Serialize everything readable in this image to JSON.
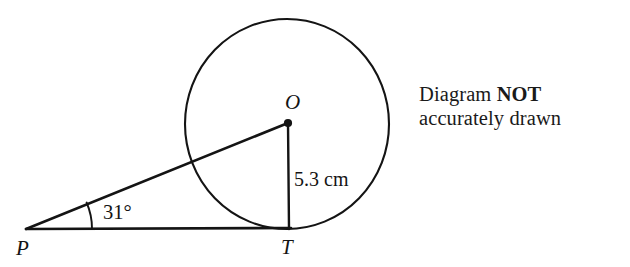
{
  "figure": {
    "type": "circle-tangent-geometry",
    "points": [
      {
        "id": "P",
        "label": "P",
        "role": "external-point",
        "x": 26,
        "y": 229
      },
      {
        "id": "T",
        "label": "T",
        "role": "tangent-point",
        "x": 289,
        "y": 228
      },
      {
        "id": "O",
        "label": "O",
        "role": "circle-center",
        "x": 288,
        "y": 123
      }
    ],
    "circle": {
      "center_x": 287,
      "center_y": 124,
      "radius_x": 102,
      "radius_y": 105
    },
    "segments": [
      {
        "id": "PO",
        "from": "P",
        "to": "O",
        "role": "hypotenuse"
      },
      {
        "id": "PT",
        "from": "P",
        "to": "T",
        "role": "tangent-line"
      },
      {
        "id": "OT",
        "from": "O",
        "to": "T",
        "role": "radius"
      }
    ],
    "angle": {
      "at": "P",
      "value": "31",
      "unit": "°",
      "label": "31°"
    },
    "measure": {
      "segment": "OT",
      "value": "5.3",
      "unit": "cm",
      "label": "5.3 cm"
    },
    "stroke_color": "#141414",
    "background_color": "#ffffff"
  },
  "note": {
    "line1_prefix": "Diagram ",
    "line1_strong": "NOT",
    "line2": "accurately drawn"
  },
  "labels": {
    "point_p": "P",
    "point_t": "T",
    "point_o": "O",
    "angle": "31°",
    "radius": "5.3 cm"
  }
}
